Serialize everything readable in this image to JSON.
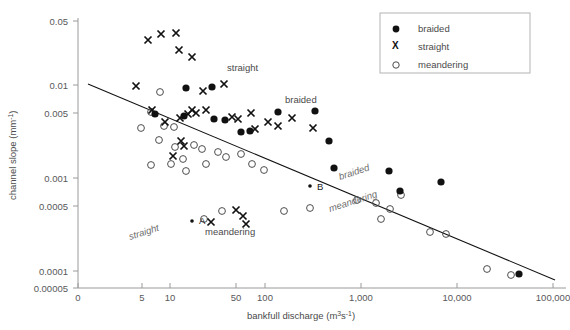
{
  "chart_data": {
    "type": "scatter",
    "title": "",
    "xlabel": "bankfull discharge (m3s-1)",
    "ylabel": "channel slope (mm-1)",
    "xscale": "log",
    "yscale": "log",
    "xlim": [
      2,
      200000
    ],
    "ylim": [
      5e-05,
      0.05
    ],
    "xticks": [
      "0",
      "5",
      "10",
      "50",
      "100",
      "1,000",
      "10,000",
      "100,000"
    ],
    "xtick_px": [
      78,
      142,
      170,
      236,
      265,
      361,
      457,
      553
    ],
    "yticks": [
      "0.05",
      "0.01",
      "0.005",
      "0.001",
      "0.0005",
      "0.0001",
      "0.00005"
    ],
    "ytick_px": [
      21,
      85,
      113,
      178,
      206,
      271,
      288
    ],
    "grid": false,
    "legend_position": "top-right",
    "series": [
      {
        "name": "braided",
        "marker": "filled-circle",
        "color": "#111111",
        "points_px": [
          [
            186,
            88
          ],
          [
            212,
            87
          ],
          [
            155,
            114
          ],
          [
            184,
            116
          ],
          [
            214,
            119
          ],
          [
            225,
            120
          ],
          [
            241,
            132
          ],
          [
            250,
            131
          ],
          [
            278,
            112
          ],
          [
            315,
            111
          ],
          [
            329,
            141
          ],
          [
            334,
            168
          ],
          [
            389,
            171
          ],
          [
            400,
            191
          ],
          [
            441,
            182
          ],
          [
            519,
            274
          ]
        ]
      },
      {
        "name": "straight",
        "marker": "x",
        "color": "#111111",
        "points_px": [
          [
            148,
            40
          ],
          [
            161,
            34
          ],
          [
            176,
            33
          ],
          [
            179,
            50
          ],
          [
            192,
            57
          ],
          [
            136,
            86
          ],
          [
            203,
            91
          ],
          [
            224,
            84
          ],
          [
            152,
            110
          ],
          [
            165,
            122
          ],
          [
            180,
            118
          ],
          [
            188,
            114
          ],
          [
            192,
            110
          ],
          [
            196,
            113
          ],
          [
            206,
            110
          ],
          [
            232,
            117
          ],
          [
            238,
            119
          ],
          [
            251,
            113
          ],
          [
            255,
            129
          ],
          [
            268,
            122
          ],
          [
            278,
            126
          ],
          [
            292,
            118
          ],
          [
            313,
            128
          ],
          [
            181,
            141
          ],
          [
            184,
            146
          ],
          [
            173,
            156
          ],
          [
            211,
            222
          ],
          [
            236,
            210
          ],
          [
            243,
            216
          ],
          [
            246,
            224
          ]
        ]
      },
      {
        "name": "meandering",
        "marker": "open-circle",
        "color": "#4d4d4d",
        "points_px": [
          [
            160,
            92
          ],
          [
            151,
            112
          ],
          [
            164,
            126
          ],
          [
            141,
            128
          ],
          [
            174,
            127
          ],
          [
            159,
            140
          ],
          [
            175,
            147
          ],
          [
            194,
            145
          ],
          [
            202,
            149
          ],
          [
            218,
            152
          ],
          [
            183,
            159
          ],
          [
            206,
            164
          ],
          [
            226,
            157
          ],
          [
            241,
            154
          ],
          [
            151,
            165
          ],
          [
            171,
            164
          ],
          [
            186,
            171
          ],
          [
            252,
            164
          ],
          [
            264,
            170
          ],
          [
            222,
            211
          ],
          [
            204,
            219
          ],
          [
            284,
            211
          ],
          [
            310,
            208
          ],
          [
            357,
            200
          ],
          [
            376,
            203
          ],
          [
            390,
            209
          ],
          [
            401,
            195
          ],
          [
            381,
            219
          ],
          [
            430,
            232
          ],
          [
            446,
            234
          ],
          [
            487,
            269
          ],
          [
            511,
            275
          ]
        ]
      }
    ],
    "trend_line_px": [
      [
        88,
        84
      ],
      [
        555,
        280
      ]
    ],
    "point_labels": [
      {
        "text": "A",
        "dot_px": [
          192,
          221
        ],
        "label_px": [
          199,
          224
        ]
      },
      {
        "text": "B",
        "dot_px": [
          310,
          186
        ],
        "label_px": [
          317,
          190
        ]
      }
    ],
    "annotations": [
      {
        "text": "straight",
        "x_px": 227,
        "y_px": 71,
        "italic": false,
        "rotate": 0
      },
      {
        "text": "braided",
        "x_px": 285,
        "y_px": 103,
        "italic": false,
        "rotate": 0
      },
      {
        "text": "braided",
        "x_px": 340,
        "y_px": 180,
        "italic": true,
        "rotate": -18
      },
      {
        "text": "meandering",
        "x_px": 330,
        "y_px": 212,
        "italic": true,
        "rotate": -18
      },
      {
        "text": "meandering",
        "x_px": 205,
        "y_px": 235,
        "italic": false,
        "rotate": 0
      },
      {
        "text": "straight",
        "x_px": 130,
        "y_px": 240,
        "italic": true,
        "rotate": -18
      }
    ]
  },
  "legend": {
    "items": [
      {
        "label": "braided",
        "marker": "filled-circle"
      },
      {
        "label": "straight",
        "marker": "x"
      },
      {
        "label": "meandering",
        "marker": "open-circle"
      }
    ]
  },
  "axes": {
    "y_title_main": "channel slope (mm",
    "y_title_sup": "-1",
    "y_title_tail": ")",
    "x_title_main": "bankfull discharge (m",
    "x_title_sup1": "3",
    "x_title_mid": "s",
    "x_title_sup2": "-1",
    "x_title_tail": ")"
  }
}
